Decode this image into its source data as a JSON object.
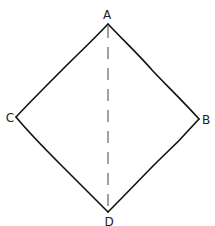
{
  "diagram": {
    "type": "quadrilateral",
    "vertices": [
      {
        "id": "A",
        "label": "A"
      },
      {
        "id": "B",
        "label": "B"
      },
      {
        "id": "C",
        "label": "C"
      },
      {
        "id": "D",
        "label": "D"
      }
    ],
    "edges": [
      {
        "from": "A",
        "to": "B",
        "style": "solid"
      },
      {
        "from": "B",
        "to": "D",
        "style": "solid"
      },
      {
        "from": "D",
        "to": "C",
        "style": "solid"
      },
      {
        "from": "C",
        "to": "A",
        "style": "solid"
      },
      {
        "from": "A",
        "to": "D",
        "style": "dashed"
      }
    ],
    "colors": {
      "line": "#111111",
      "dashed": "#444444",
      "background": "#ffffff"
    }
  }
}
